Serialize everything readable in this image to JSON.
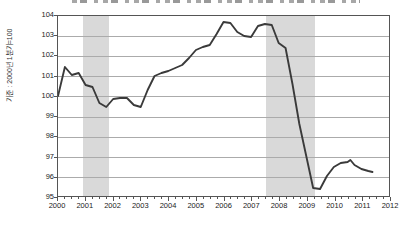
{
  "colors": {
    "line": "#3a3a3a",
    "band": "#d9d9d9",
    "grid": "#ababab",
    "frame": "#555555",
    "text": "#222222"
  },
  "chart_data": {
    "type": "line",
    "title": "",
    "ylabel": "기준 : 2000년 1분기=100",
    "xlabel": "",
    "xlim": [
      2000,
      2012
    ],
    "ylim": [
      95,
      104
    ],
    "grid": "horizontal",
    "legend": "none",
    "y_ticks": [
      104,
      103,
      102,
      101,
      100,
      99,
      98,
      97,
      96,
      95
    ],
    "x_ticks": [
      2000,
      2001,
      2002,
      2003,
      2004,
      2005,
      2006,
      2007,
      2008,
      2009,
      2010,
      2011,
      2012
    ],
    "minor_x_tick_step": 0.25,
    "shaded_bands_x": [
      [
        2000.9,
        2001.85
      ],
      [
        2007.5,
        2009.27
      ]
    ],
    "series": [
      {
        "name": "index (2000 Q1 = 100)",
        "points": [
          [
            2000.0,
            100.0
          ],
          [
            2000.25,
            101.45
          ],
          [
            2000.5,
            101.05
          ],
          [
            2000.75,
            101.15
          ],
          [
            2001.0,
            100.55
          ],
          [
            2001.25,
            100.45
          ],
          [
            2001.5,
            99.65
          ],
          [
            2001.75,
            99.45
          ],
          [
            2002.0,
            99.85
          ],
          [
            2002.25,
            99.9
          ],
          [
            2002.5,
            99.9
          ],
          [
            2002.75,
            99.55
          ],
          [
            2003.0,
            99.45
          ],
          [
            2003.25,
            100.3
          ],
          [
            2003.5,
            101.0
          ],
          [
            2003.75,
            101.15
          ],
          [
            2004.0,
            101.25
          ],
          [
            2004.25,
            101.4
          ],
          [
            2004.5,
            101.55
          ],
          [
            2004.75,
            101.9
          ],
          [
            2005.0,
            102.3
          ],
          [
            2005.25,
            102.45
          ],
          [
            2005.5,
            102.55
          ],
          [
            2005.75,
            103.1
          ],
          [
            2006.0,
            103.7
          ],
          [
            2006.25,
            103.65
          ],
          [
            2006.5,
            103.2
          ],
          [
            2006.75,
            103.0
          ],
          [
            2007.0,
            102.95
          ],
          [
            2007.25,
            103.5
          ],
          [
            2007.5,
            103.6
          ],
          [
            2007.75,
            103.55
          ],
          [
            2008.0,
            102.65
          ],
          [
            2008.25,
            102.4
          ],
          [
            2008.5,
            100.6
          ],
          [
            2008.75,
            98.6
          ],
          [
            2009.0,
            97.0
          ],
          [
            2009.25,
            95.4
          ],
          [
            2009.5,
            95.35
          ],
          [
            2009.75,
            96.0
          ],
          [
            2010.0,
            96.45
          ],
          [
            2010.25,
            96.65
          ],
          [
            2010.5,
            96.7
          ],
          [
            2010.6,
            96.8
          ],
          [
            2010.75,
            96.55
          ],
          [
            2011.0,
            96.35
          ],
          [
            2011.25,
            96.25
          ],
          [
            2011.4,
            96.2
          ]
        ]
      }
    ]
  }
}
